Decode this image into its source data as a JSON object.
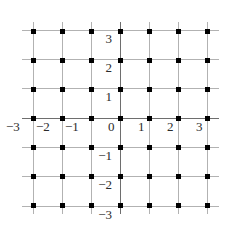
{
  "figure": {
    "title": "",
    "background_color": "#ffffff",
    "grid_line_color": "#b2b2b2",
    "axis_line_color": "#6e6e6e",
    "dot_color": "#000000"
  },
  "chart_data": {
    "type": "scatter",
    "title": "",
    "xlabel": "",
    "ylabel": "",
    "xlim": [
      -3,
      3
    ],
    "ylim": [
      -3,
      3
    ],
    "grid": true,
    "legend": null,
    "x_tick_labels": [
      "−3",
      "−2",
      "−1",
      "0",
      "1",
      "2",
      "3"
    ],
    "y_tick_labels": [
      "3",
      "2",
      "1",
      "−1",
      "−2",
      "−3"
    ],
    "x_ticks": [
      -3,
      -2,
      -1,
      0,
      1,
      2,
      3
    ],
    "y_ticks": [
      3,
      2,
      1,
      -1,
      -2,
      -3
    ],
    "points": [
      {
        "x": -3,
        "y": 3
      },
      {
        "x": -2,
        "y": 3
      },
      {
        "x": -1,
        "y": 3
      },
      {
        "x": 0,
        "y": 3
      },
      {
        "x": 1,
        "y": 3
      },
      {
        "x": 2,
        "y": 3
      },
      {
        "x": 3,
        "y": 3
      },
      {
        "x": -3,
        "y": 2
      },
      {
        "x": -2,
        "y": 2
      },
      {
        "x": -1,
        "y": 2
      },
      {
        "x": 0,
        "y": 2
      },
      {
        "x": 1,
        "y": 2
      },
      {
        "x": 2,
        "y": 2
      },
      {
        "x": 3,
        "y": 2
      },
      {
        "x": -3,
        "y": 1
      },
      {
        "x": -2,
        "y": 1
      },
      {
        "x": -1,
        "y": 1
      },
      {
        "x": 0,
        "y": 1
      },
      {
        "x": 1,
        "y": 1
      },
      {
        "x": 2,
        "y": 1
      },
      {
        "x": 3,
        "y": 1
      },
      {
        "x": -3,
        "y": 0
      },
      {
        "x": -2,
        "y": 0
      },
      {
        "x": -1,
        "y": 0
      },
      {
        "x": 0,
        "y": 0
      },
      {
        "x": 1,
        "y": 0
      },
      {
        "x": 2,
        "y": 0
      },
      {
        "x": 3,
        "y": 0
      },
      {
        "x": -3,
        "y": -1
      },
      {
        "x": -2,
        "y": -1
      },
      {
        "x": -1,
        "y": -1
      },
      {
        "x": 0,
        "y": -1
      },
      {
        "x": 1,
        "y": -1
      },
      {
        "x": 2,
        "y": -1
      },
      {
        "x": 3,
        "y": -1
      },
      {
        "x": -3,
        "y": -2
      },
      {
        "x": -2,
        "y": -2
      },
      {
        "x": -1,
        "y": -2
      },
      {
        "x": 0,
        "y": -2
      },
      {
        "x": 1,
        "y": -2
      },
      {
        "x": 2,
        "y": -2
      },
      {
        "x": 3,
        "y": -2
      },
      {
        "x": -3,
        "y": -3
      },
      {
        "x": -2,
        "y": -3
      },
      {
        "x": -1,
        "y": -3
      },
      {
        "x": 0,
        "y": -3
      },
      {
        "x": 1,
        "y": -3
      },
      {
        "x": 2,
        "y": -3
      },
      {
        "x": 3,
        "y": -3
      }
    ]
  },
  "labels": {
    "x": {
      "neg3": "−3",
      "neg2": "−2",
      "neg1": "−1",
      "zero": "0",
      "pos1": "1",
      "pos2": "2",
      "pos3": "3"
    },
    "y": {
      "pos3": "3",
      "pos2": "2",
      "pos1": "1",
      "neg1": "−1",
      "neg2": "−2",
      "neg3": "−3"
    }
  }
}
